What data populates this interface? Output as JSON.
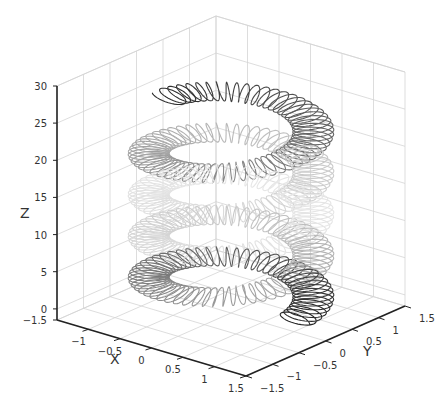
{
  "chart_data": {
    "type": "line",
    "subtype": "3d-parametric-curve",
    "title": "",
    "xlabel": "X",
    "ylabel": "Y",
    "zlabel": "Z",
    "xlim": [
      -1.5,
      1.5
    ],
    "ylim": [
      -1.5,
      1.5
    ],
    "zlim": [
      -1.5,
      30
    ],
    "xticks": [
      "-1",
      "-0.5",
      "0",
      "0.5",
      "1",
      "1.5"
    ],
    "yticks": [
      "-1.5",
      "-1",
      "-0.5",
      "0",
      "0.5",
      "1",
      "1.5"
    ],
    "zticks": [
      "-1.5",
      "0",
      "5",
      "10",
      "15",
      "20",
      "25",
      "30"
    ],
    "grid": true,
    "legend": null,
    "series": [
      {
        "name": "spring",
        "major_radius": 1.0,
        "minor_radius": 0.25,
        "z_start": 0,
        "z_end": 25,
        "turns_major": 4.5,
        "coils_per_turn": 60,
        "shading": [
          "#333333",
          "#e6e6e6",
          "#333333"
        ]
      }
    ]
  }
}
